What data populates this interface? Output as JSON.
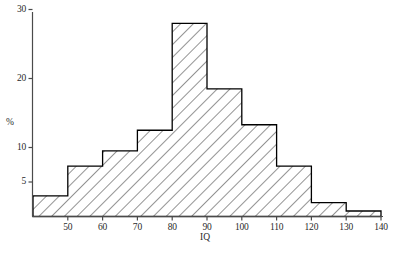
{
  "chart_data": {
    "type": "bar",
    "title": "",
    "subtitle": "",
    "xlabel": "IQ",
    "ylabel": "%",
    "bin_edges": [
      40,
      50,
      60,
      70,
      80,
      90,
      100,
      110,
      120,
      130,
      140
    ],
    "categories": [
      "40-50",
      "50-60",
      "60-70",
      "70-80",
      "80-90",
      "90-100",
      "100-110",
      "110-120",
      "120-130",
      "130-140"
    ],
    "values": [
      3.0,
      7.3,
      9.5,
      12.5,
      28.0,
      18.5,
      13.3,
      7.3,
      2.0,
      0.8
    ],
    "xlim": [
      40,
      140
    ],
    "ylim": [
      0,
      30
    ],
    "x_ticks": [
      50,
      60,
      70,
      80,
      90,
      100,
      110,
      120,
      130,
      140
    ],
    "x_tick_labels": [
      "50",
      "60",
      "70",
      "80",
      "90",
      "100",
      "110",
      "120",
      "130",
      "140"
    ],
    "y_ticks": [
      5,
      10,
      20,
      30
    ],
    "y_tick_labels": [
      "5",
      "10",
      "20",
      "30"
    ],
    "grid": false,
    "legend": null,
    "bar_fill": "hatch-diagonal",
    "bar_edge_color": "#000000",
    "hatch_color": "#333333",
    "axis_color": "#3a3a3a",
    "background_color": "#ffffff"
  },
  "axes": {
    "y_title": "%",
    "x_title": "IQ"
  }
}
